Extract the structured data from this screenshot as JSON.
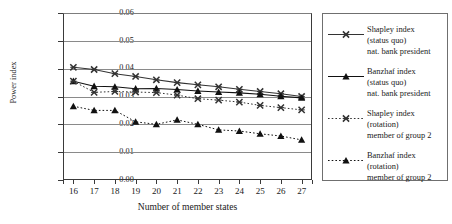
{
  "chart_data": {
    "type": "line",
    "title": "",
    "xlabel": "Number of member states",
    "ylabel": "Power index",
    "x": [
      16,
      17,
      18,
      19,
      20,
      21,
      22,
      23,
      24,
      25,
      26,
      27
    ],
    "xtick_labels": [
      "16",
      "17",
      "18",
      "19",
      "20",
      "21",
      "22",
      "23",
      "24",
      "25",
      "26",
      "27"
    ],
    "ytick_labels": [
      "0.00",
      "0.01",
      "0.02",
      "0.03",
      "0.04",
      "0.05",
      "0.06"
    ],
    "ytick_values": [
      0.0,
      0.01,
      0.02,
      0.03,
      0.04,
      0.05,
      0.06
    ],
    "ylim": [
      0.0,
      0.06
    ],
    "xlim": [
      15.5,
      27.5
    ],
    "grid": true,
    "grid_axis": "y",
    "legend_position": "right-outside",
    "series": [
      {
        "name": "Shapley index (status quo) nat. bank president",
        "label_lines": [
          "Shapley index",
          "(status quo)",
          "nat. bank president"
        ],
        "marker": "x",
        "line": "solid",
        "color": "#333333",
        "values": [
          0.0405,
          0.0397,
          0.0382,
          0.0372,
          0.036,
          0.035,
          0.0342,
          0.0335,
          0.0326,
          0.0318,
          0.031,
          0.03
        ]
      },
      {
        "name": "Banzhaf index (status quo) nat. bank president",
        "label_lines": [
          "Banzhaf index",
          "(status quo)",
          "nat. bank president"
        ],
        "marker": "triangle",
        "line": "solid",
        "color": "#111111",
        "values": [
          0.0355,
          0.0337,
          0.0335,
          0.0328,
          0.0329,
          0.0325,
          0.032,
          0.0316,
          0.0313,
          0.0308,
          0.0301,
          0.0295
        ]
      },
      {
        "name": "Shapley index (rotation) member of group 2",
        "label_lines": [
          "Shapley index",
          "(rotation)",
          "member of group 2"
        ],
        "marker": "x",
        "line": "dotted",
        "color": "#333333",
        "values": [
          0.0355,
          0.0315,
          0.0318,
          0.0316,
          0.0314,
          0.0305,
          0.0292,
          0.0287,
          0.028,
          0.0268,
          0.026,
          0.0252
        ]
      },
      {
        "name": "Banzhaf index (rotation) member of group 2",
        "label_lines": [
          "Banzhaf index",
          "(rotation)",
          "member of group 2"
        ],
        "marker": "triangle",
        "line": "dotted",
        "color": "#111111",
        "values": [
          0.0265,
          0.025,
          0.025,
          0.0209,
          0.02,
          0.0216,
          0.02,
          0.018,
          0.0176,
          0.0166,
          0.0158,
          0.0144
        ]
      }
    ]
  }
}
